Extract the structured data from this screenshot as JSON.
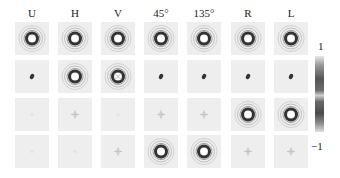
{
  "columns": [
    "U",
    "H",
    "V",
    "45°",
    "135°",
    "R",
    "L"
  ],
  "rows": [
    [
      "ring",
      "ring",
      "ring",
      "ring",
      "ring",
      "ring",
      "ring"
    ],
    [
      "dot",
      "ring",
      "ringx",
      "dot",
      "dot",
      "dot",
      "dot"
    ],
    [
      "faint",
      "cross",
      "faint",
      "cross",
      "cross",
      "ring",
      "ring"
    ],
    [
      "faint",
      "faint",
      "cross",
      "ring",
      "ring",
      "cross",
      "cross"
    ]
  ],
  "colorbar": {
    "max_label": "1",
    "min_label": "−1",
    "colors": {
      "high": "#e6e6e6",
      "mid": "#555555",
      "low": "#dedede"
    }
  },
  "chart_data": {
    "type": "heatmap",
    "title": "",
    "x_labels": [
      "U",
      "H",
      "V",
      "45°",
      "135°",
      "R",
      "L"
    ],
    "rows": 4,
    "patterns": [
      [
        "ring",
        "ring",
        "ring",
        "ring",
        "ring",
        "ring",
        "ring"
      ],
      [
        "dot",
        "ring",
        "ring",
        "dot",
        "dot",
        "dot",
        "dot"
      ],
      [
        "faint",
        "faint-cross",
        "faint",
        "faint-cross",
        "faint-cross",
        "ring",
        "ring"
      ],
      [
        "faint",
        "faint",
        "faint-cross",
        "ring",
        "ring",
        "faint-cross",
        "faint-cross"
      ]
    ],
    "colorbar_range": [
      -1,
      1
    ]
  }
}
